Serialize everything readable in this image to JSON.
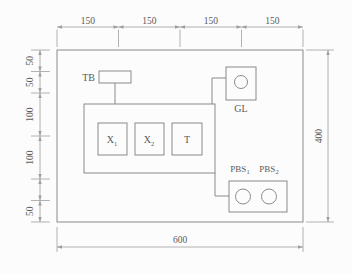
{
  "drawing_title": "panel layout dimensioned drawing 600x400",
  "dims": {
    "top": [
      "150",
      "150",
      "150",
      "150"
    ],
    "left": [
      "50",
      "50",
      "100",
      "100",
      "",
      "50"
    ],
    "bottom": "600",
    "right": "400"
  },
  "components": {
    "tb": {
      "label": "TB"
    },
    "gl": {
      "label": "GL"
    },
    "x1": {
      "base": "X",
      "sub": "1"
    },
    "x2": {
      "base": "X",
      "sub": "2"
    },
    "t": {
      "label": "T"
    },
    "pbs1": {
      "base": "PBS",
      "sub": "1"
    },
    "pbs2": {
      "base": "PBS",
      "sub": "2"
    }
  },
  "colors": {
    "object_line": "#8a8a8a",
    "dimension_line": "#9e9e9e",
    "text": "#5a5a5a",
    "tb_fill": "#d8d8d8",
    "t_fill": "#dcdcdc",
    "pbs2_fill": "#a8a8a8",
    "background": "#fcfcfc"
  }
}
